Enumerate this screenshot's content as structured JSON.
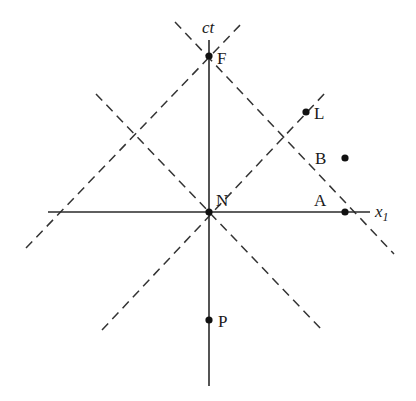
{
  "diagram": {
    "type": "spacetime-diagram",
    "axes": {
      "vertical": {
        "label": "ct",
        "x": 209,
        "y1": 40,
        "y2": 386
      },
      "horizontal": {
        "label": "x",
        "subscript": "1",
        "y": 212,
        "x1": 48,
        "x2": 370
      }
    },
    "points": [
      {
        "id": "F",
        "label": "F",
        "x": 209,
        "y": 56,
        "lx": 217,
        "ly": 64
      },
      {
        "id": "N",
        "label": "N",
        "x": 209,
        "y": 212,
        "lx": 216,
        "ly": 206
      },
      {
        "id": "P",
        "label": "P",
        "x": 209,
        "y": 320,
        "lx": 218,
        "ly": 327
      },
      {
        "id": "A",
        "label": "A",
        "x": 345,
        "y": 212,
        "lx": 314,
        "ly": 206
      },
      {
        "id": "B",
        "label": "B",
        "x": 345,
        "y": 158,
        "lx": 315,
        "ly": 164
      },
      {
        "id": "L",
        "label": "L",
        "x": 306,
        "y": 112,
        "lx": 314,
        "ly": 119
      }
    ],
    "dashed_lines": [
      {
        "name": "light-cone-F-left",
        "x1": 26,
        "y1": 248,
        "x2": 243,
        "y2": 22
      },
      {
        "name": "light-cone-F-right",
        "x1": 175,
        "y1": 22,
        "x2": 394,
        "y2": 254
      },
      {
        "name": "light-cone-N-down-right",
        "x1": 96,
        "y1": 94,
        "x2": 322,
        "y2": 330
      },
      {
        "name": "light-cone-N-up-right",
        "x1": 102,
        "y1": 330,
        "x2": 326,
        "y2": 92
      }
    ],
    "colors": {
      "ink": "#1a1a1a",
      "background": "#ffffff"
    }
  }
}
